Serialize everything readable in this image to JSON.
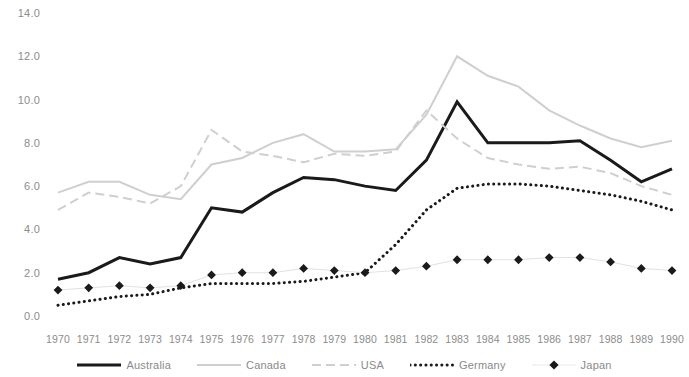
{
  "chart_data": {
    "type": "line",
    "title": "",
    "subtitle": "",
    "xlabel": "",
    "ylabel": "",
    "grid": false,
    "legend_position": "bottom",
    "x": [
      1970,
      1971,
      1972,
      1973,
      1974,
      1975,
      1976,
      1977,
      1978,
      1979,
      1980,
      1981,
      1982,
      1983,
      1984,
      1985,
      1986,
      1987,
      1988,
      1989,
      1990
    ],
    "categories": [
      "1970",
      "1971",
      "1972",
      "1973",
      "1974",
      "1975",
      "1976",
      "1977",
      "1978",
      "1979",
      "1980",
      "1981",
      "1982",
      "1983",
      "1984",
      "1985",
      "1986",
      "1987",
      "1988",
      "1989",
      "1990"
    ],
    "xlim": [
      1970,
      1990
    ],
    "ylim": [
      0.0,
      14.0
    ],
    "ytick_labels": [
      "0.0",
      "2.0",
      "4.0",
      "6.0",
      "8.0",
      "10.0",
      "12.0",
      "14.0"
    ],
    "ytick_values": [
      0.0,
      2.0,
      4.0,
      6.0,
      8.0,
      10.0,
      12.0,
      14.0
    ],
    "series": [
      {
        "name": "Australia",
        "style": "solid-thick",
        "color": "#1a1a1a",
        "marker": "none",
        "values": [
          1.7,
          2.0,
          2.7,
          2.4,
          2.7,
          5.0,
          4.8,
          5.7,
          6.4,
          6.3,
          6.0,
          5.8,
          7.2,
          9.9,
          8.0,
          8.0,
          8.0,
          8.1,
          7.2,
          6.2,
          6.8
        ]
      },
      {
        "name": "Canada",
        "style": "solid-light",
        "color": "#cfcfcf",
        "marker": "none",
        "values": [
          5.7,
          6.2,
          6.2,
          5.6,
          5.4,
          7.0,
          7.3,
          8.0,
          8.4,
          7.6,
          7.6,
          7.7,
          9.3,
          12.0,
          11.1,
          10.6,
          9.5,
          8.8,
          8.2,
          7.8,
          8.1
        ]
      },
      {
        "name": "USA",
        "style": "dashed",
        "color": "#cfcfcf",
        "marker": "none",
        "values": [
          4.9,
          5.7,
          5.5,
          5.2,
          6.0,
          8.6,
          7.6,
          7.4,
          7.1,
          7.5,
          7.4,
          7.6,
          9.5,
          8.2,
          7.3,
          7.0,
          6.8,
          6.9,
          6.6,
          6.0,
          5.6
        ]
      },
      {
        "name": "Germany",
        "style": "dotted",
        "color": "#1a1a1a",
        "marker": "none",
        "values": [
          0.5,
          0.7,
          0.9,
          1.0,
          1.3,
          1.5,
          1.5,
          1.5,
          1.6,
          1.8,
          2.0,
          3.3,
          4.9,
          5.9,
          6.1,
          6.1,
          6.0,
          5.8,
          5.6,
          5.3,
          4.9
        ]
      },
      {
        "name": "Japan",
        "style": "marker-diamond",
        "color": "#1a1a1a",
        "marker": "diamond",
        "values": [
          1.2,
          1.3,
          1.4,
          1.3,
          1.4,
          1.9,
          2.0,
          2.0,
          2.2,
          2.1,
          2.0,
          2.1,
          2.3,
          2.6,
          2.6,
          2.6,
          2.7,
          2.7,
          2.5,
          2.2,
          2.1
        ]
      }
    ]
  },
  "legend": {
    "items": [
      {
        "label": "Australia",
        "icon": "solid-thick-line-icon"
      },
      {
        "label": "Canada",
        "icon": "solid-light-line-icon"
      },
      {
        "label": "USA",
        "icon": "dashed-line-icon"
      },
      {
        "label": "Germany",
        "icon": "dotted-line-icon"
      },
      {
        "label": "Japan",
        "icon": "diamond-marker-icon"
      }
    ]
  }
}
